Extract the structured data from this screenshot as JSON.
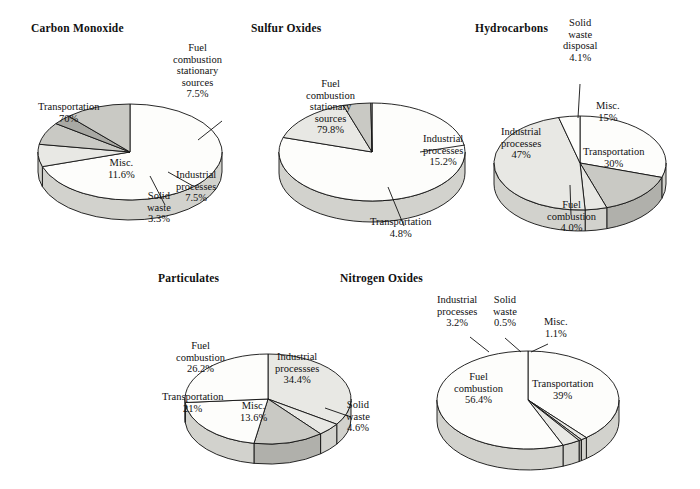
{
  "figure": {
    "background": "#ffffff",
    "ink": "#111111",
    "palette": {
      "white": "#fdfdfb",
      "light": "#e8e8e4",
      "medium": "#c9c9c4",
      "dark": "#a9a9a4",
      "wall_light": "#d2d2cd",
      "wall_medium": "#b0b0ab",
      "wall_dark": "#9a9a95",
      "outline": "#111111"
    }
  },
  "chart_data": [
    {
      "type": "pie",
      "id": "carbon-monoxide",
      "title": "Carbon Monoxide",
      "title_pos": {
        "x": 31,
        "y": 22
      },
      "center": {
        "x": 130,
        "y": 152
      },
      "rx": 92,
      "ry": 48,
      "depth": 20,
      "start_angle": 0,
      "categories": [
        "Transportation",
        "Fuel combustion stationary sources",
        "Industrial processes",
        "Solid waste",
        "Misc."
      ],
      "values": [
        70,
        7.5,
        7.5,
        3.3,
        11.6
      ],
      "value_labels": [
        "70%",
        "7.5%",
        "7.5%",
        "3.3%",
        "11.6%"
      ],
      "slices": [
        {
          "label": "Transportation",
          "value": "70%",
          "shade": "white",
          "inside": true,
          "lx": 68,
          "ly": 112
        },
        {
          "label": "Fuel\ncombustion\nstationary\nsources",
          "value": "7.5%",
          "shade": "light",
          "inside": false,
          "lx": 197,
          "ly": 71,
          "leader": [
            [
              222,
              121
            ],
            [
              198,
              140
            ]
          ]
        },
        {
          "label": "Industrial\nprocesses",
          "value": "7.5%",
          "shade": "medium",
          "inside": false,
          "lx": 196,
          "ly": 186,
          "leader": [
            [
              193,
              186
            ],
            [
              168,
              172
            ]
          ]
        },
        {
          "label": "Solid\nwaste",
          "value": "3.3%",
          "shade": "dark",
          "inside": false,
          "lx": 159,
          "ly": 207,
          "leader": [
            [
              165,
              205
            ],
            [
              150,
              176
            ]
          ]
        },
        {
          "label": "Misc.",
          "value": "11.6%",
          "shade": "medium",
          "inside": true,
          "lx": 121,
          "ly": 168
        }
      ]
    },
    {
      "type": "pie",
      "id": "sulfur-oxides",
      "title": "Sulfur Oxides",
      "title_pos": {
        "x": 251,
        "y": 22
      },
      "center": {
        "x": 372,
        "y": 152
      },
      "rx": 93,
      "ry": 49,
      "depth": 21,
      "start_angle": 0,
      "categories": [
        "Fuel combustion stationary sources",
        "Industrial processes",
        "Transportation",
        "Misc."
      ],
      "values": [
        79.8,
        15.2,
        4.8,
        0.2
      ],
      "value_labels": [
        "79.8%",
        "15.2%",
        "4.8%",
        ""
      ],
      "slices": [
        {
          "label": "Fuel\ncombustion\nstationary\nsources",
          "value": "79.8%",
          "shade": "white",
          "inside": true,
          "lx": 330,
          "ly": 107
        },
        {
          "label": "Industrial\nprocesses",
          "value": "15.2%",
          "shade": "light",
          "inside": false,
          "lx": 443,
          "ly": 150,
          "leader": [
            [
              465,
              145
            ],
            [
              420,
              152
            ]
          ]
        },
        {
          "label": "Transportation",
          "value": "4.8%",
          "shade": "medium",
          "inside": false,
          "lx": 400,
          "ly": 227,
          "leader": [
            [
              404,
              226
            ],
            [
              388,
              187
            ]
          ]
        }
      ]
    },
    {
      "type": "pie",
      "id": "hydrocarbons",
      "title": "Hydrocarbons",
      "title_pos": {
        "x": 475,
        "y": 22
      },
      "center": {
        "x": 580,
        "y": 163
      },
      "rx": 86,
      "ry": 47,
      "depth": 21,
      "start_angle": 0,
      "categories": [
        "Transportation",
        "Misc.",
        "Solid waste disposal",
        "Industrial processes",
        "Fuel combustion"
      ],
      "values": [
        30,
        15,
        4.1,
        47,
        4.0
      ],
      "value_labels": [
        "30%",
        "15%",
        "4.1%",
        "47%",
        "4.0%"
      ],
      "slices": [
        {
          "label": "Transportation",
          "value": "30%",
          "shade": "white",
          "inside": true,
          "lx": 613,
          "ly": 157
        },
        {
          "label": "Misc.",
          "value": "15%",
          "shade": "medium",
          "inside": true,
          "lx": 608,
          "ly": 111
        },
        {
          "label": "Solid\nwaste\ndisposal",
          "value": "4.1%",
          "shade": "light",
          "inside": false,
          "lx": 580,
          "ly": 40,
          "leader": [
            [
              580,
              84
            ],
            [
              578,
              118
            ]
          ]
        },
        {
          "label": "Industrial\nprocesses",
          "value": "47%",
          "shade": "light",
          "inside": true,
          "lx": 521,
          "ly": 143
        },
        {
          "label": "Fuel\ncombustion",
          "value": "4.0%",
          "shade": "white",
          "inside": false,
          "lx": 571,
          "ly": 216,
          "leader": [
            [
              571,
              215
            ],
            [
              570,
              185
            ]
          ]
        }
      ]
    },
    {
      "type": "pie",
      "id": "particulates",
      "title": "Particulates",
      "title_pos": {
        "x": 158,
        "y": 272
      },
      "center": {
        "x": 268,
        "y": 399
      },
      "rx": 83,
      "ry": 45,
      "depth": 20,
      "start_angle": 0,
      "categories": [
        "Industrial processses",
        "Solid waste",
        "Misc.",
        "Transportation",
        "Fuel combustion"
      ],
      "values": [
        34.4,
        4.6,
        13.6,
        21,
        26.2
      ],
      "value_labels": [
        "34.4%",
        "4.6%",
        "13.6%",
        "21%",
        "26.2%"
      ],
      "slices": [
        {
          "label": "Industrial\nprocessses",
          "value": "34.4%",
          "shade": "light",
          "inside": true,
          "lx": 297,
          "ly": 368
        },
        {
          "label": "Solid\nwaste",
          "value": "4.6%",
          "shade": "light",
          "inside": false,
          "lx": 358,
          "ly": 416,
          "leader": [
            [
              351,
              417
            ],
            [
              325,
              408
            ]
          ]
        },
        {
          "label": "Misc.",
          "value": "13.6%",
          "shade": "medium",
          "inside": true,
          "lx": 253,
          "ly": 411
        },
        {
          "label": "Transportation",
          "value": "21%",
          "shade": "white",
          "inside": true,
          "lx": 192,
          "ly": 402
        },
        {
          "label": "Fuel\ncombustion",
          "value": "26.2%",
          "shade": "white",
          "inside": true,
          "lx": 200,
          "ly": 357
        }
      ]
    },
    {
      "type": "pie",
      "id": "nitrogen-oxides",
      "title": "Nitrogen Oxides",
      "title_pos": {
        "x": 340,
        "y": 272
      },
      "center": {
        "x": 528,
        "y": 400
      },
      "rx": 91,
      "ry": 49,
      "depth": 21,
      "start_angle": 0,
      "categories": [
        "Transportation",
        "Misc.",
        "Solid waste",
        "Industrial processes",
        "Fuel combustion"
      ],
      "values": [
        39,
        1.1,
        0.5,
        3.2,
        56.4
      ],
      "value_labels": [
        "39%",
        "1.1%",
        "0.5%",
        "3.2%",
        "56.4%"
      ],
      "slices": [
        {
          "label": "Transportation",
          "value": "39%",
          "shade": "white",
          "inside": true,
          "lx": 562,
          "ly": 389
        },
        {
          "label": "Misc.",
          "value": "1.1%",
          "shade": "light",
          "inside": false,
          "lx": 556,
          "ly": 327,
          "leader": [
            [
              548,
              344
            ],
            [
              531,
              352
            ]
          ]
        },
        {
          "label": "Solid\nwaste",
          "value": "0.5%",
          "shade": "medium",
          "inside": false,
          "lx": 505,
          "ly": 311,
          "leader": [
            [
              505,
              338
            ],
            [
              521,
              352
            ]
          ]
        },
        {
          "label": "Industrial\nprocesses",
          "value": "3.2%",
          "shade": "light",
          "inside": false,
          "lx": 457,
          "ly": 311,
          "leader": [
            [
              470,
              337
            ],
            [
              489,
              352
            ]
          ]
        },
        {
          "label": "Fuel\ncombustion",
          "value": "56.4%",
          "shade": "white",
          "inside": true,
          "lx": 478,
          "ly": 388
        }
      ]
    }
  ]
}
